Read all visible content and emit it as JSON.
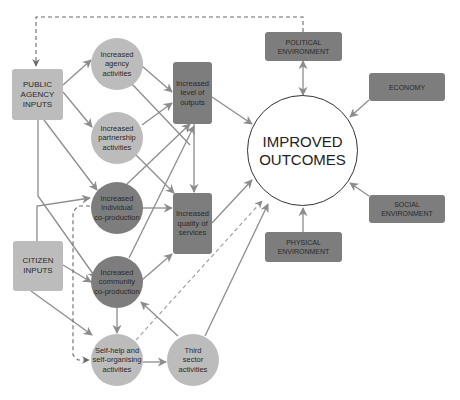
{
  "diagram": {
    "colors": {
      "light_node": "#bcbcbc",
      "dark_node": "#7d7d7d",
      "arrow": "#8c8c8c",
      "outline": "#333333"
    },
    "inputs": {
      "public_agency": "PUBLIC\nAGENCY\nINPUTS",
      "citizen": "CITIZEN\nINPUTS"
    },
    "activities": {
      "agency": "Increased\nagency\nactivities",
      "partnership": "Increased\npartnership\nactivities",
      "individual": "Increased\nindividual\nco-production",
      "community": "Increased\ncommunity\nco-production",
      "self_help": "Self-help and\nself-organising\nactivities",
      "third_sector": "Third\nsector\nactivities"
    },
    "results": {
      "outputs": "Increased\nlevel of\noutputs",
      "quality": "Increased\nquality of\nservices"
    },
    "outcome": "IMPROVED\nOUTCOMES",
    "environment": {
      "political": "POLITICAL\nENVIRONMENT",
      "economy": "ECONOMY",
      "social": "SOCIAL\nENVIRONMENT",
      "physical": "PHYSICAL\nENVIRONMENT"
    }
  }
}
